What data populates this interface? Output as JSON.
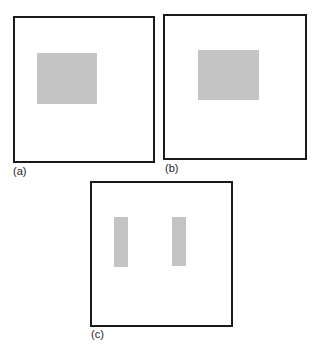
{
  "figure": {
    "panels": [
      {
        "id": "a",
        "label": "(a)",
        "shape": "single wide gray rectangle"
      },
      {
        "id": "b",
        "label": "(b)",
        "shape": "single wide gray rectangle"
      },
      {
        "id": "c",
        "label": "(c)",
        "shape": "two narrow vertical gray bars"
      }
    ],
    "colors": {
      "frame": "#1a1a1a",
      "fill": "#c4c4c4",
      "background": "#ffffff"
    }
  }
}
